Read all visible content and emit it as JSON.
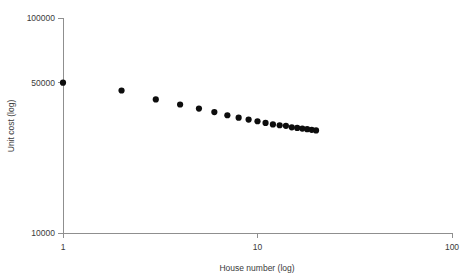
{
  "chart_data": {
    "type": "scatter",
    "title": "",
    "xlabel": "House number (log)",
    "ylabel": "Unit cost (log)",
    "xscale": "log",
    "yscale": "log",
    "xlim": [
      1,
      100
    ],
    "ylim": [
      10000,
      100000
    ],
    "grid": false,
    "legend": null,
    "x_ticks": [
      {
        "value": 1,
        "label": "1"
      },
      {
        "value": 10,
        "label": "10"
      },
      {
        "value": 100,
        "label": "100"
      }
    ],
    "y_ticks": [
      {
        "value": 10000,
        "label": "10000"
      },
      {
        "value": 50000,
        "label": "50000"
      },
      {
        "value": 100000,
        "label": "100000"
      }
    ],
    "series": [
      {
        "name": "Unit cost",
        "marker": "filled-circle",
        "color": "#0d0d0d",
        "x": [
          1,
          2,
          3,
          4,
          5,
          6,
          7,
          8,
          9,
          10,
          11,
          12,
          13,
          14,
          15,
          16,
          17,
          18,
          19,
          20
        ],
        "y": [
          50000,
          46000,
          41800,
          39600,
          37900,
          36500,
          35300,
          34400,
          33700,
          33100,
          32500,
          32000,
          31700,
          31500,
          31000,
          30800,
          30600,
          30400,
          30200,
          30000
        ]
      }
    ]
  },
  "axes": {
    "x_axis_title": "House number (log)",
    "y_axis_title": "Unit cost (log)"
  },
  "geometry": {
    "x_origin_px": 63,
    "y_baseline_px": 233,
    "decade_width_px": 194.5,
    "decade_height_px": 215,
    "marker_radius_px": 3.1
  }
}
